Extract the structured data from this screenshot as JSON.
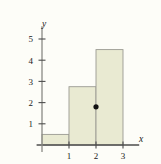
{
  "chart_data": {
    "type": "bar",
    "title": "",
    "subtitle": "",
    "xlabel": "x",
    "ylabel": "y",
    "categories": [
      "0-1",
      "1-2",
      "2-3"
    ],
    "bins": [
      {
        "x0": 0,
        "x1": 1,
        "height": 0.5
      },
      {
        "x0": 1,
        "x1": 2,
        "height": 2.75
      },
      {
        "x0": 2,
        "x1": 3,
        "height": 4.5
      }
    ],
    "values": [
      0.5,
      2.75,
      4.5
    ],
    "xticks": [
      "1",
      "2",
      "3"
    ],
    "xtick_values": [
      1,
      2,
      3
    ],
    "yticks": [
      "1",
      "2",
      "3",
      "4",
      "5"
    ],
    "ytick_values": [
      1,
      2,
      3,
      4,
      5
    ],
    "xlim": [
      -0.2,
      3.6
    ],
    "ylim": [
      0,
      5.6
    ],
    "grid": false,
    "legend": null,
    "annotations": [
      {
        "name": "point-marker",
        "x": 2,
        "y": 1.8,
        "label": ""
      }
    ],
    "colors": {
      "bar_fill": "#e9ead2",
      "bar_stroke": "#9a9a92",
      "axis": "#4d4d4d",
      "marker": "#111111",
      "background": "#fdfdf8",
      "text": "#1a1a1a"
    }
  }
}
